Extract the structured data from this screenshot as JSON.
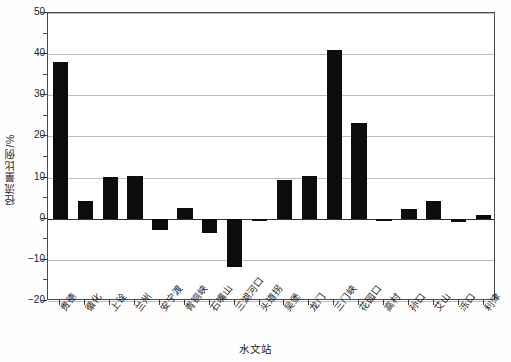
{
  "chart_data": {
    "type": "bar",
    "title": "",
    "xlabel": "水文站",
    "ylabel": "径流量比例/%",
    "ylim": [
      -20,
      50
    ],
    "ytick_values": [
      -20,
      -10,
      0,
      10,
      20,
      30,
      40,
      50
    ],
    "ytick_labels": [
      "-20",
      "-10",
      "0",
      "10",
      "20",
      "30",
      "40",
      "50"
    ],
    "yminor_step": 5,
    "grid": "horizontal",
    "legend": "none",
    "bar_color": "#0d0d0d",
    "categories": [
      "贵德",
      "循化",
      "上诠",
      "兰州",
      "安宁渡",
      "青铜峡",
      "石嘴山",
      "三湖河口",
      "头道拐",
      "吴堡",
      "龙门",
      "三门峡",
      "花园口",
      "高村",
      "孙口",
      "艾山",
      "泺口",
      "利津"
    ],
    "values": [
      38.0,
      4.3,
      10.2,
      10.3,
      -2.8,
      2.5,
      -3.5,
      -11.8,
      -0.5,
      9.5,
      10.5,
      41.0,
      23.2,
      -0.6,
      2.4,
      4.3,
      -0.8,
      1.0
    ]
  }
}
